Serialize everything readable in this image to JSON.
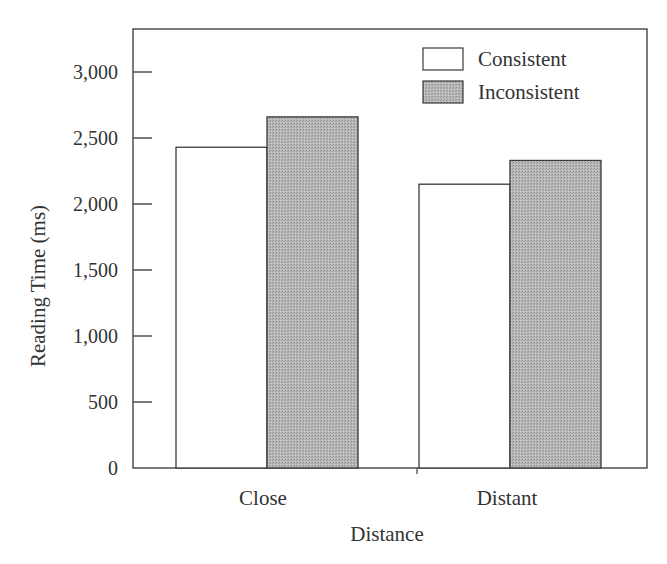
{
  "chart_data": {
    "type": "bar",
    "title": "",
    "xlabel": "Distance",
    "ylabel": "Reading Time (ms)",
    "categories": [
      "Close",
      "Distant"
    ],
    "series": [
      {
        "name": "Consistent",
        "values": [
          2430,
          2150
        ],
        "fill": "#ffffff"
      },
      {
        "name": "Inconsistent",
        "values": [
          2660,
          2330
        ],
        "fill": "#b3b3b3"
      }
    ],
    "ylim": [
      0,
      3300
    ],
    "yticks": [
      0,
      500,
      1000,
      1500,
      2000,
      2500,
      3000
    ],
    "ytick_labels": [
      "0",
      "500",
      "1,000",
      "1,500",
      "2,000",
      "2,500",
      "3,000"
    ],
    "grid": false,
    "legend_position": "upper right"
  }
}
